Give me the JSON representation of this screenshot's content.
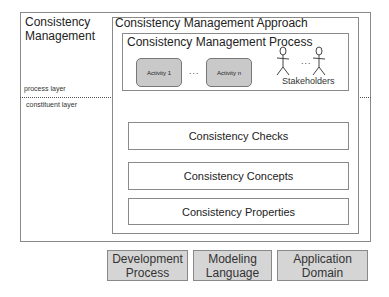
{
  "outer": {
    "title_line1": "Consistency",
    "title_line2": "Management",
    "process_layer_label": "process layer",
    "constituent_layer_label": "constituent layer"
  },
  "approach": {
    "title": "Consistency Management Approach",
    "process": {
      "title": "Consistency Management Process",
      "activities": [
        "Activity 1",
        "Activity n"
      ],
      "ellipsis": "...",
      "stakeholders_label": "Stakeholders",
      "stakeholders_ellipsis": "..."
    },
    "components": [
      "Consistency Checks",
      "Consistency Concepts",
      "Consistency Properties"
    ]
  },
  "foundations": [
    {
      "line1": "Development",
      "line2": "Process"
    },
    {
      "line1": "Modeling",
      "line2": "Language"
    },
    {
      "line1": "Application",
      "line2": "Domain"
    }
  ]
}
